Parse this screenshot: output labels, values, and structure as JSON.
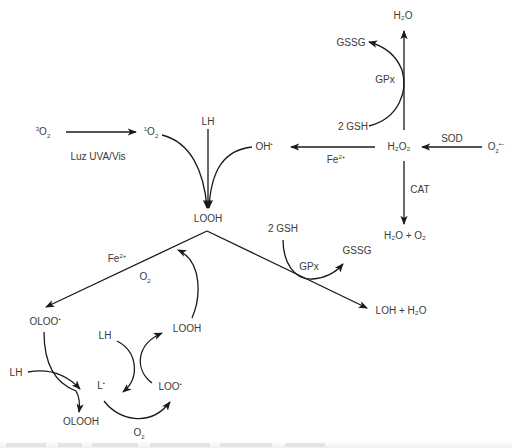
{
  "diagram": {
    "nodes": {
      "triplet_o2": {
        "pre": "3",
        "base": "O",
        "sub": "2",
        "post": ""
      },
      "singlet_o2": {
        "pre": "1",
        "base": "O",
        "sub": "2",
        "post": ""
      },
      "lh_top": {
        "text": "LH"
      },
      "hydroxyl_radical": {
        "text": "OH",
        "sup": "•"
      },
      "looh_center": {
        "text": "LOOH"
      },
      "h2o2": {
        "text": "H₂O₂"
      },
      "superoxide": {
        "base": "O",
        "sub": "2",
        "sup": "•−"
      },
      "h2o_top": {
        "text": "H₂O"
      },
      "gssg_top": {
        "text": "GSSG"
      },
      "gsh_top": {
        "text": "2 GSH"
      },
      "h2o_o2": {
        "text": "H₂O + O₂"
      },
      "gsh_mid": {
        "text": "2 GSH"
      },
      "gssg_mid": {
        "text": "GSSG"
      },
      "loh_h2o": {
        "text": "LOH + H₂O"
      },
      "oloo_radical": {
        "text": "OLOO",
        "sup": "•"
      },
      "looh_cycle": {
        "text": "LOOH"
      },
      "lh_cycle": {
        "text": "LH"
      },
      "lh_left": {
        "text": "LH"
      },
      "l_radical": {
        "text": "L",
        "sup": "•"
      },
      "loo_radical": {
        "text": "LOO",
        "sup": "•"
      },
      "olooh": {
        "text": "OLOOH"
      }
    },
    "edge_labels": {
      "light": "Luz UVA/Vis",
      "fe_fenton": {
        "base": "Fe",
        "sup": "2+"
      },
      "sod": "SOD",
      "gpx_top": "GPx",
      "cat": "CAT",
      "gpx_mid": "GPx",
      "fe_left": {
        "base": "Fe",
        "sup": "2+"
      },
      "o2_left": {
        "base": "O",
        "sub": "2"
      },
      "o2_bottom": {
        "base": "O",
        "sub": "2"
      }
    },
    "edges": [
      {
        "from": "3O2",
        "to": "1O2",
        "label": "Luz UVA/Vis"
      },
      {
        "from": "1O2",
        "to": "LOOH"
      },
      {
        "from": "LH",
        "to": "LOOH"
      },
      {
        "from": "OH•",
        "to": "LOOH"
      },
      {
        "from": "H2O2",
        "to": "OH•",
        "label": "Fe2+"
      },
      {
        "from": "O2•−",
        "to": "H2O2",
        "label": "SOD"
      },
      {
        "from": "H2O2",
        "to": "H2O",
        "label": "GPx",
        "cofactor": "2 GSH → GSSG"
      },
      {
        "from": "H2O2",
        "to": "H2O + O2",
        "label": "CAT"
      },
      {
        "from": "LOOH",
        "to": "LOH + H2O",
        "label": "GPx",
        "cofactor": "2 GSH → GSSG"
      },
      {
        "from": "LOOH",
        "to": "OLOO•",
        "label": "Fe2+ / O2"
      },
      {
        "from": "OLOO•",
        "to": "OLOOH",
        "cofactor": "LH → L•"
      },
      {
        "from": "LH",
        "to": "L•"
      },
      {
        "from": "L•",
        "to": "LOO•",
        "label": "O2"
      },
      {
        "from": "LOO•",
        "to": "LOOH"
      }
    ]
  }
}
